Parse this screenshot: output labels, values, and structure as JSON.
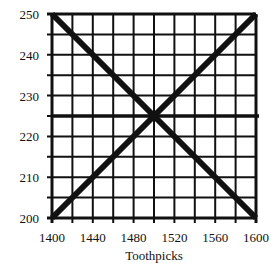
{
  "chart_data": {
    "type": "line",
    "title": "",
    "xlabel": "Toothpicks",
    "ylabel": "",
    "xlim": [
      1400,
      1600
    ],
    "ylim": [
      200,
      250
    ],
    "x_ticks": [
      1400,
      1440,
      1480,
      1520,
      1560,
      1600
    ],
    "y_ticks": [
      200,
      210,
      220,
      230,
      240,
      250
    ],
    "x_grid_step": 20,
    "y_grid_step": 5,
    "grid": true,
    "legend": null,
    "series": [
      {
        "name": "decreasing line",
        "points": [
          [
            1400,
            250
          ],
          [
            1600,
            200
          ]
        ]
      },
      {
        "name": "increasing line",
        "points": [
          [
            1400,
            200
          ],
          [
            1600,
            250
          ]
        ]
      },
      {
        "name": "horizontal line",
        "points": [
          [
            1400,
            225
          ],
          [
            1600,
            225
          ]
        ]
      }
    ],
    "annotations": [
      {
        "type": "intersection",
        "x": 1500,
        "y": 225
      }
    ]
  },
  "layout": {
    "plot": {
      "left": 52,
      "top": 14,
      "right": 256,
      "bottom": 218
    },
    "colors": {
      "grid": "#111111",
      "line": "#111111",
      "background": "#ffffff"
    }
  }
}
